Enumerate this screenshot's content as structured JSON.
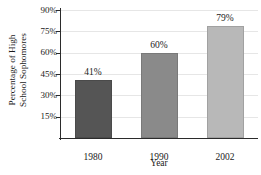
{
  "chart_data": {
    "type": "bar",
    "title": "",
    "subtitle": "",
    "xlabel": "Year",
    "ylabel": "Percentage of High School Sophomores",
    "ylabel_line1": "Percentage of High",
    "ylabel_line2": "School Sophomores",
    "categories": [
      "1980",
      "1990",
      "2002"
    ],
    "values": [
      41,
      60,
      79
    ],
    "value_labels": [
      "41%",
      "60%",
      "79%"
    ],
    "ylim": [
      0,
      90
    ],
    "ytick_values": [
      15,
      30,
      45,
      60,
      75,
      90
    ],
    "ytick_labels": [
      "15%",
      "30%",
      "45%",
      "60%",
      "75%",
      "90%"
    ],
    "grid": true,
    "grid_axis": "y",
    "legend": "none",
    "bar_colors": [
      "#555555",
      "#8a8a8a",
      "#b8b8b8"
    ],
    "grid_color": "#e6e6e6",
    "axis_color": "#2b2b2b",
    "background_color": "#ffffff",
    "units": "percent"
  }
}
